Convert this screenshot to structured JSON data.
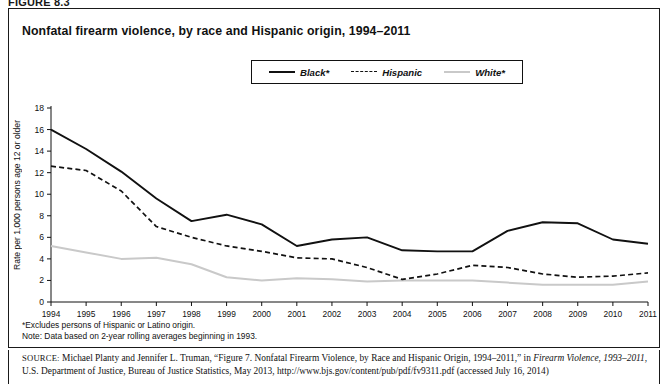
{
  "figure_label": "FIGURE 8.3",
  "title": "Nonfatal firearm violence, by race and Hispanic origin, 1994–2011",
  "legend": [
    {
      "label": "Black*",
      "key": "solid-black-line-key",
      "color": "#111111",
      "style": "solid"
    },
    {
      "label": "Hispanic",
      "key": "dashed-black-line-key",
      "color": "#111111",
      "style": "dashed"
    },
    {
      "label": "White*",
      "key": "solid-gray-line-key",
      "color": "#c9c9c9",
      "style": "solid"
    }
  ],
  "axes": {
    "ylabel": "Rate per 1,000 persons age 12 or older",
    "yticks": [
      "0",
      "2",
      "4",
      "6",
      "8",
      "10",
      "12",
      "14",
      "16",
      "18"
    ],
    "xticks": [
      "1994",
      "1995",
      "1996",
      "1997",
      "1998",
      "1999",
      "2000",
      "2001",
      "2002",
      "2003",
      "2004",
      "2005",
      "2006",
      "2007",
      "2008",
      "2009",
      "2010",
      "2011"
    ]
  },
  "footnotes": [
    "*Excludes persons of Hispanic or Latino origin.",
    "Note: Data based on 2-year rolling averages beginning in 1993."
  ],
  "source": {
    "prefix": "SOURCE:",
    "line1_a": " Michael Planty and Jennifer L. Truman, “Figure 7. Nonfatal Firearm Violence, by Race and Hispanic Origin, 1994–2011,” in ",
    "line1_italic": "Firearm Violence,",
    "line2_italic": "1993–2011",
    "line2_b": ", U.S. Department of Justice, Bureau of Justice Statistics, May 2013, http://www.bjs.gov/content/pub/pdf/fv9311.pdf (accessed July 16, 2014)"
  },
  "chart_data": {
    "type": "line",
    "title": "Nonfatal firearm violence, by race and Hispanic origin, 1994–2011",
    "xlabel": "",
    "ylabel": "Rate per 1,000 persons age 12 or older",
    "xlim": [
      1994,
      2011
    ],
    "ylim": [
      0,
      18
    ],
    "ytick_step": 2,
    "grid": false,
    "legend_position": "top-center",
    "x": [
      1994,
      1995,
      1996,
      1997,
      1998,
      1999,
      2000,
      2001,
      2002,
      2003,
      2004,
      2005,
      2006,
      2007,
      2008,
      2009,
      2010,
      2011
    ],
    "series": [
      {
        "name": "Black*",
        "color": "#111111",
        "style": "solid",
        "values": [
          16.0,
          14.2,
          12.1,
          9.6,
          7.5,
          8.1,
          7.2,
          5.2,
          5.8,
          6.0,
          4.8,
          4.7,
          4.7,
          6.6,
          7.4,
          7.3,
          5.8,
          5.4
        ]
      },
      {
        "name": "Hispanic",
        "color": "#111111",
        "style": "dashed",
        "values": [
          12.6,
          12.2,
          10.3,
          7.0,
          6.0,
          5.2,
          4.7,
          4.1,
          4.0,
          3.2,
          2.1,
          2.6,
          3.4,
          3.2,
          2.6,
          2.3,
          2.4,
          2.7
        ]
      },
      {
        "name": "White*",
        "color": "#c9c9c9",
        "style": "solid",
        "values": [
          5.2,
          4.6,
          4.0,
          4.1,
          3.5,
          2.3,
          2.0,
          2.2,
          2.1,
          1.9,
          2.0,
          2.0,
          2.0,
          1.8,
          1.6,
          1.6,
          1.6,
          1.9
        ]
      }
    ]
  }
}
